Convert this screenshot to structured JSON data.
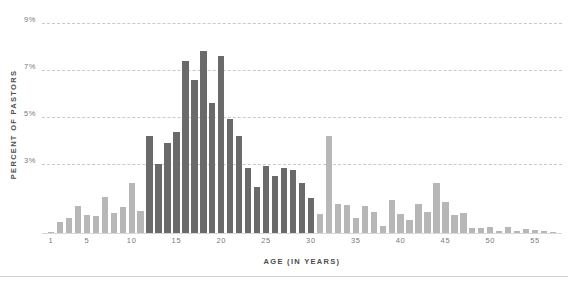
{
  "chart_data": {
    "type": "bar",
    "title": "",
    "subtitle": "",
    "xlabel": "AGE (IN YEARS)",
    "ylabel": "PERCENT OF PASTORS",
    "xlim": [
      0,
      58
    ],
    "ylim": [
      0,
      9.4
    ],
    "grid": true,
    "gridlines": [
      3,
      5,
      7,
      9
    ],
    "ytick_labels": [
      "3%",
      "5%",
      "7%",
      "9%"
    ],
    "ytick_values": [
      3,
      5,
      7,
      9
    ],
    "xtick_labels": [
      "1",
      "5",
      "10",
      "15",
      "20",
      "25",
      "30",
      "35",
      "40",
      "45",
      "50",
      "55"
    ],
    "xtick_values": [
      1,
      5,
      10,
      15,
      20,
      25,
      30,
      35,
      40,
      45,
      50,
      55
    ],
    "legend": [],
    "legend_position": "none",
    "value_unit": "%",
    "categories": [
      1,
      2,
      3,
      4,
      5,
      6,
      7,
      8,
      9,
      10,
      11,
      12,
      13,
      14,
      15,
      16,
      17,
      18,
      19,
      20,
      21,
      22,
      23,
      24,
      25,
      26,
      27,
      28,
      29,
      30,
      31,
      32,
      33,
      34,
      35,
      36,
      37,
      38,
      39,
      40,
      41,
      42,
      43,
      44,
      45,
      46,
      47,
      48,
      49,
      50,
      51,
      52,
      53,
      54,
      55,
      56,
      57
    ],
    "values": [
      0.1,
      0.5,
      0.7,
      1.2,
      0.8,
      0.75,
      1.6,
      0.9,
      1.15,
      2.2,
      1.0,
      4.2,
      3.0,
      3.9,
      4.35,
      7.4,
      6.6,
      7.8,
      5.6,
      7.6,
      4.9,
      4.2,
      2.8,
      2.0,
      2.9,
      2.5,
      2.8,
      2.75,
      2.2,
      1.55,
      0.85,
      4.2,
      1.3,
      1.25,
      0.7,
      1.2,
      0.95,
      0.35,
      1.45,
      0.85,
      0.6,
      1.3,
      0.95,
      2.2,
      1.35,
      0.8,
      0.9,
      0.25,
      0.25,
      0.3,
      0.12,
      0.3,
      0.15,
      0.2,
      0.18,
      0.12,
      0.1
    ],
    "bar_colors": [
      "#b7b7b7",
      "#b7b7b7",
      "#b7b7b7",
      "#b7b7b7",
      "#b7b7b7",
      "#b7b7b7",
      "#b7b7b7",
      "#b7b7b7",
      "#b7b7b7",
      "#b7b7b7",
      "#b7b7b7",
      "#6a6a6a",
      "#6a6a6a",
      "#6a6a6a",
      "#6a6a6a",
      "#6a6a6a",
      "#6a6a6a",
      "#6a6a6a",
      "#6a6a6a",
      "#6a6a6a",
      "#6a6a6a",
      "#6a6a6a",
      "#6a6a6a",
      "#6a6a6a",
      "#6a6a6a",
      "#6a6a6a",
      "#6a6a6a",
      "#6a6a6a",
      "#6a6a6a",
      "#6a6a6a",
      "#b7b7b7",
      "#b7b7b7",
      "#b7b7b7",
      "#b7b7b7",
      "#b7b7b7",
      "#b7b7b7",
      "#b7b7b7",
      "#b7b7b7",
      "#b7b7b7",
      "#b7b7b7",
      "#b7b7b7",
      "#b7b7b7",
      "#b7b7b7",
      "#b7b7b7",
      "#b7b7b7",
      "#b7b7b7",
      "#b7b7b7",
      "#b7b7b7",
      "#b7b7b7",
      "#b7b7b7",
      "#b7b7b7",
      "#b7b7b7",
      "#b7b7b7",
      "#b7b7b7",
      "#b7b7b7",
      "#b7b7b7",
      "#b7b7b7"
    ],
    "highlight_color": "#6a6a6a",
    "base_color": "#b7b7b7",
    "grid_color": "#c9c9c9",
    "axis_label_color": "#4d4d4d",
    "tick_label_color": "#7a7a7a"
  }
}
